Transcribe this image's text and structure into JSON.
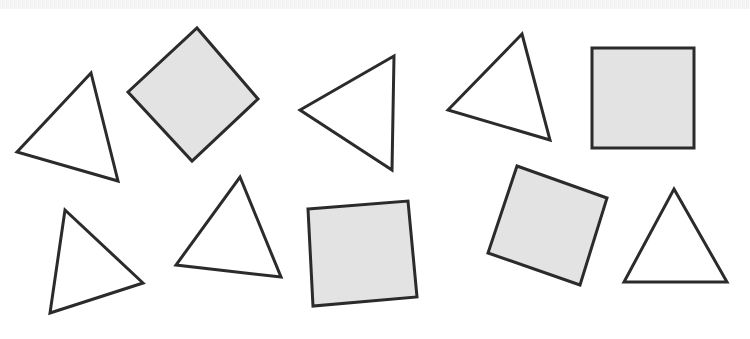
{
  "figure": {
    "width": 750,
    "height": 339,
    "background_color": "#ffffff",
    "stroke_color": "#2b2b2b",
    "fill_gray": "#e3e3e3",
    "fill_white": "#ffffff",
    "stroke_width": 3,
    "scan_band": {
      "label": "scan-noise-strip",
      "top": 0,
      "height": 9,
      "color": "#f2f2f2"
    },
    "counts": {
      "triangles": 7,
      "squares": 4,
      "total": 11
    }
  },
  "shapes": [
    {
      "id": "triangle-1",
      "type": "triangle",
      "label": "Triangle 1",
      "fill": "#ffffff",
      "points": "91,73 17,152 118,181",
      "row": "top",
      "order": 1
    },
    {
      "id": "square-1",
      "type": "square",
      "label": "Square 1 (diamond)",
      "fill": "#e3e3e3",
      "points": "197,28 258,99 192,161 128,92",
      "row": "top",
      "order": 2
    },
    {
      "id": "triangle-2",
      "type": "triangle",
      "label": "Triangle 2",
      "fill": "#ffffff",
      "points": "394,56 300,110 392,170",
      "row": "top",
      "order": 3
    },
    {
      "id": "triangle-3",
      "type": "triangle",
      "label": "Triangle 3",
      "fill": "#ffffff",
      "points": "522,34 448,110 550,140",
      "row": "top",
      "order": 4
    },
    {
      "id": "square-2",
      "type": "square",
      "label": "Square 2 (upright)",
      "fill": "#e3e3e3",
      "points": "592,48 694,48 694,148 592,148",
      "row": "top",
      "order": 5
    },
    {
      "id": "triangle-4",
      "type": "triangle",
      "label": "Triangle 4",
      "fill": "#ffffff",
      "points": "65,210 143,283 50,313",
      "row": "bottom",
      "order": 6
    },
    {
      "id": "triangle-5",
      "type": "triangle",
      "label": "Triangle 5",
      "fill": "#ffffff",
      "points": "240,177 281,277 176,265",
      "row": "bottom",
      "order": 7
    },
    {
      "id": "square-3",
      "type": "square",
      "label": "Square 3 (tilted left)",
      "fill": "#e3e3e3",
      "points": "308,209 408,201 417,297 313,306",
      "row": "bottom",
      "order": 8
    },
    {
      "id": "square-4",
      "type": "square",
      "label": "Square 4 (tilted right)",
      "fill": "#e3e3e3",
      "points": "517,166 607,198 580,285 488,253",
      "row": "bottom",
      "order": 9
    },
    {
      "id": "triangle-6",
      "type": "triangle",
      "label": "Triangle 6",
      "fill": "#ffffff",
      "points": "674,189 727,282 624,282",
      "row": "bottom",
      "order": 10
    },
    {
      "id": "triangle-7",
      "type": "triangle",
      "label": "Triangle 7 (partial, top row left of square 2)",
      "fill": "#ffffff",
      "points": "-1,-1 -1,-1 -1,-1",
      "row": "none",
      "order": 11,
      "hidden": true
    }
  ]
}
